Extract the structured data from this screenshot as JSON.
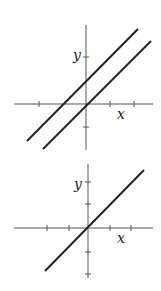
{
  "graphs": [
    {
      "id": "top",
      "x_label": "x",
      "y_label": "y",
      "lines": [
        "y = x + 1",
        "y = x"
      ],
      "description": "Two parallel lines with slope 1; one through the origin, one shifted up"
    },
    {
      "id": "bottom",
      "x_label": "x",
      "y_label": "y",
      "lines": [
        "y = x"
      ],
      "description": "Single line with slope 1 through the origin"
    }
  ],
  "colors": {
    "ink": "#222222",
    "axis": "#555555",
    "background": "#ffffff"
  }
}
